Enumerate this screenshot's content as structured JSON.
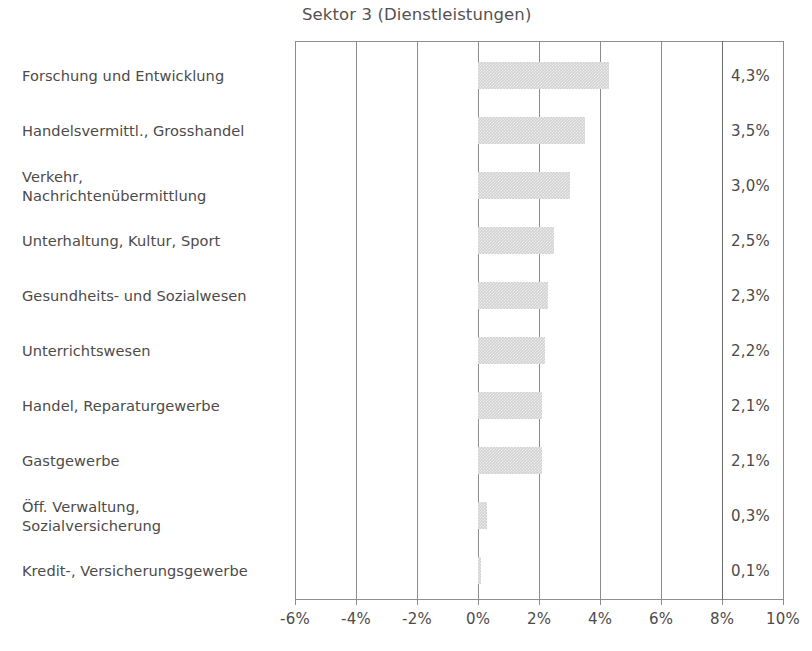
{
  "chart_data": {
    "type": "bar",
    "orientation": "horizontal",
    "title": "Sektor 3 (Dienstleistungen)",
    "xlabel": "",
    "ylabel": "",
    "xlim": [
      -6,
      10
    ],
    "xticks": [
      "-6%",
      "-4%",
      "-2%",
      "0%",
      "2%",
      "4%",
      "6%",
      "8%",
      "10%"
    ],
    "xtick_values": [
      -6,
      -4,
      -2,
      0,
      2,
      4,
      6,
      8,
      10
    ],
    "grid": true,
    "legend": "none",
    "categories": [
      "Forschung und Entwicklung",
      "Handelsvermittl., Grosshandel",
      "Verkehr, Nachrichtenübermittlung",
      "Unterhaltung, Kultur, Sport",
      "Gesundheits- und Sozialwesen",
      "Unterrichtswesen",
      "Handel, Reparaturgewerbe",
      "Gastgewerbe",
      "Öff. Verwaltung, Sozialversicherung",
      "Kredit-, Versicherungsgewerbe"
    ],
    "values": [
      4.3,
      3.5,
      3.0,
      2.5,
      2.3,
      2.2,
      2.1,
      2.1,
      0.3,
      0.1
    ],
    "value_labels": [
      "4,3%",
      "3,5%",
      "3,0%",
      "2,5%",
      "2,3%",
      "2,2%",
      "2,1%",
      "2,1%",
      "0,3%",
      "0,1%"
    ],
    "bar_color": "#d2d2d2"
  },
  "rows": [
    {
      "label_lines": [
        "Forschung und Entwicklung"
      ],
      "value": 4.3,
      "value_label": "4,3%"
    },
    {
      "label_lines": [
        "Handelsvermittl., Grosshandel"
      ],
      "value": 3.5,
      "value_label": "3,5%"
    },
    {
      "label_lines": [
        "Verkehr,",
        "Nachrichtenübermittlung"
      ],
      "value": 3.0,
      "value_label": "3,0%"
    },
    {
      "label_lines": [
        "Unterhaltung, Kultur, Sport"
      ],
      "value": 2.5,
      "value_label": "2,5%"
    },
    {
      "label_lines": [
        "Gesundheits- und Sozialwesen"
      ],
      "value": 2.3,
      "value_label": "2,3%"
    },
    {
      "label_lines": [
        "Unterrichtswesen"
      ],
      "value": 2.2,
      "value_label": "2,2%"
    },
    {
      "label_lines": [
        "Handel, Reparaturgewerbe"
      ],
      "value": 2.1,
      "value_label": "2,1%"
    },
    {
      "label_lines": [
        "Gastgewerbe"
      ],
      "value": 2.1,
      "value_label": "2,1%"
    },
    {
      "label_lines": [
        "Öff. Verwaltung,",
        "Sozialversicherung"
      ],
      "value": 0.3,
      "value_label": "0,3%"
    },
    {
      "label_lines": [
        "Kredit-, Versicherungsgewerbe"
      ],
      "value": 0.1,
      "value_label": "0,1%"
    }
  ],
  "axis": {
    "ticks": [
      "-6%",
      "-4%",
      "-2%",
      "0%",
      "2%",
      "4%",
      "6%",
      "8%",
      "10%"
    ],
    "tick_values": [
      -6,
      -4,
      -2,
      0,
      2,
      4,
      6,
      8,
      10
    ]
  }
}
